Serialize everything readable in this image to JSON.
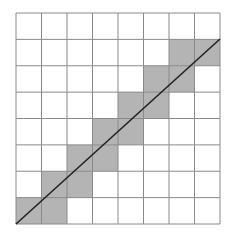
{
  "diagram": {
    "type": "grid-line-rasterization",
    "grid": {
      "rows": 8,
      "cols": 8,
      "left": 16,
      "top": 13,
      "right": 220,
      "bottom": 224,
      "line_color": "#8a8a8a",
      "background_color": "#ffffff"
    },
    "shaded_cells": [
      {
        "row": 1,
        "col": 6
      },
      {
        "row": 1,
        "col": 7
      },
      {
        "row": 2,
        "col": 5
      },
      {
        "row": 2,
        "col": 6
      },
      {
        "row": 3,
        "col": 4
      },
      {
        "row": 3,
        "col": 5
      },
      {
        "row": 4,
        "col": 3
      },
      {
        "row": 4,
        "col": 4
      },
      {
        "row": 5,
        "col": 2
      },
      {
        "row": 5,
        "col": 3
      },
      {
        "row": 6,
        "col": 1
      },
      {
        "row": 6,
        "col": 2
      },
      {
        "row": 7,
        "col": 0
      },
      {
        "row": 7,
        "col": 1
      }
    ],
    "shade_color": "#b4b4b4",
    "diagonal_line": {
      "from": {
        "x": 16,
        "y": 224
      },
      "to": {
        "x": 220,
        "y": 39
      },
      "color": "#222222",
      "width": 1.6
    }
  }
}
